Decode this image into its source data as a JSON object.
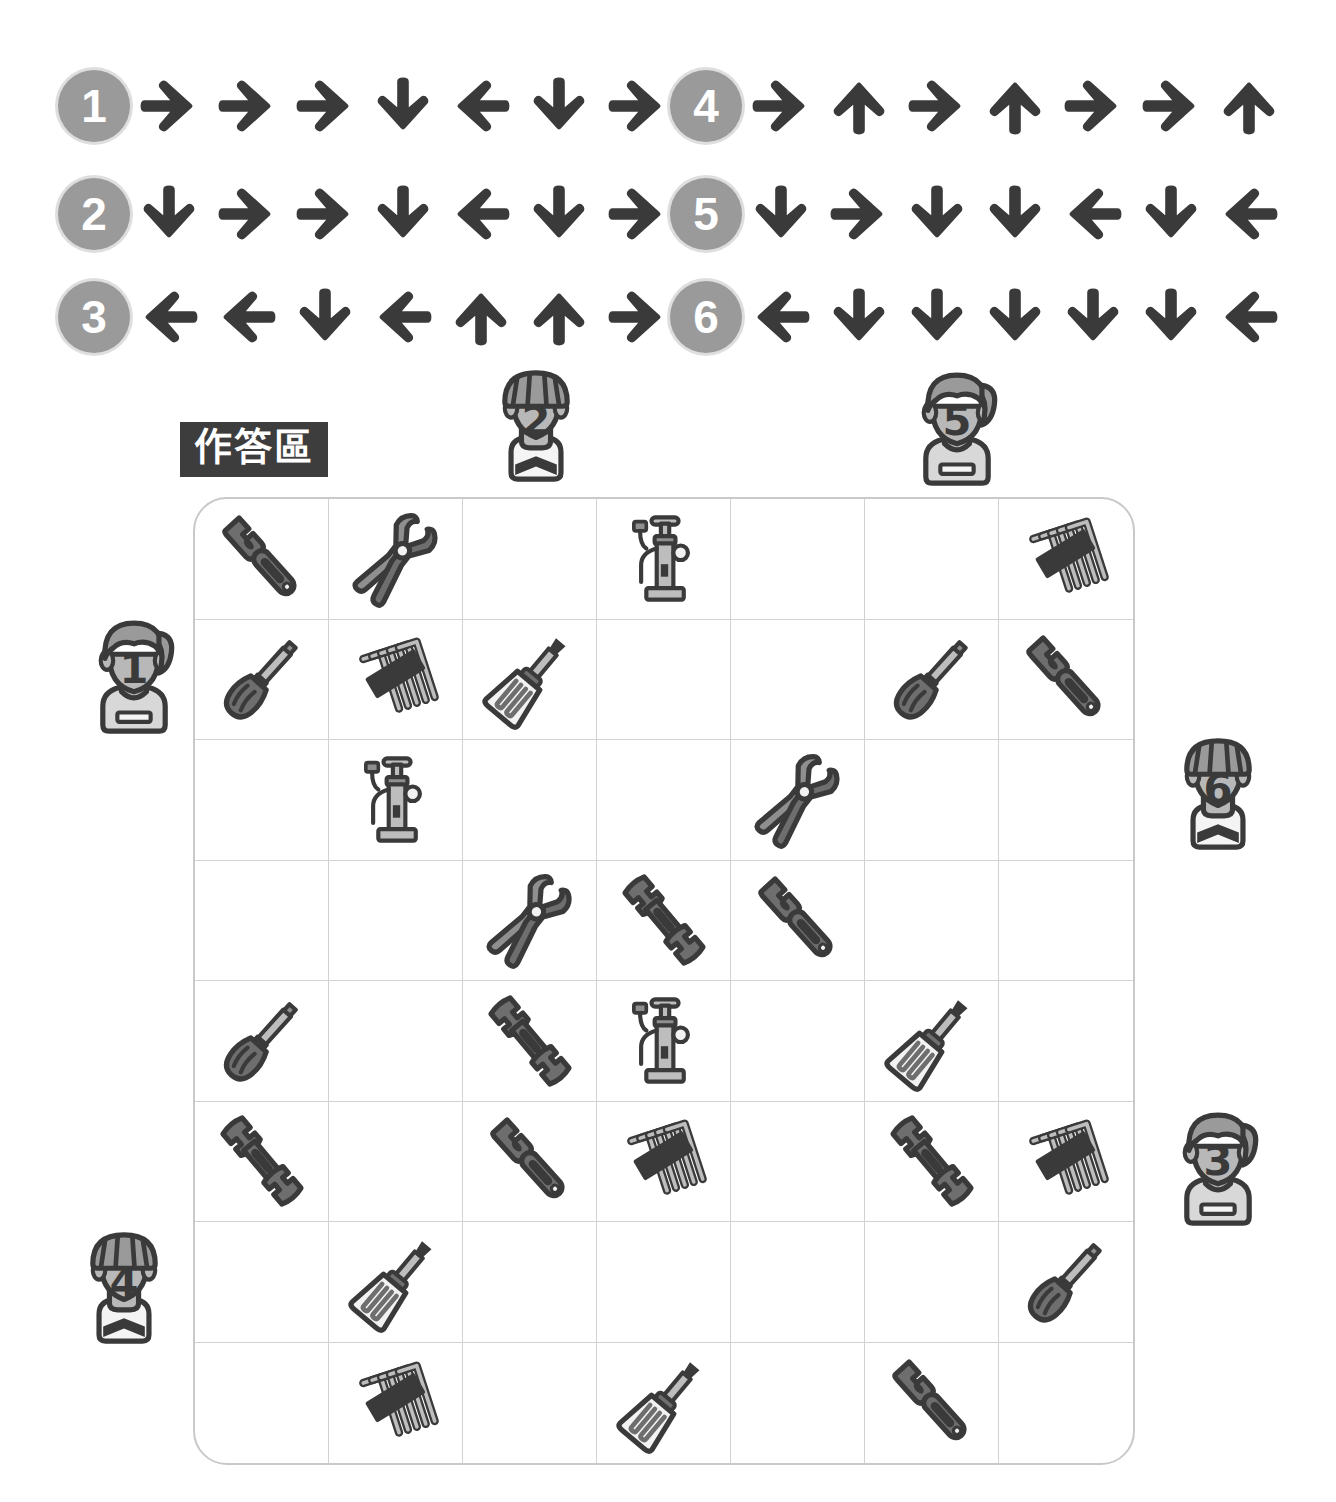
{
  "puzzle": {
    "answer_area_label": "作答區",
    "badge_color": "#9a9a9a",
    "arrow_color": "#3a3a3a",
    "grid_border_color": "#c9c9c9",
    "label_bg_color": "#3d3d3d"
  },
  "clues": [
    {
      "id": "1",
      "number": "1",
      "arrows": [
        "right",
        "right",
        "right",
        "down",
        "left",
        "down",
        "right"
      ]
    },
    {
      "id": "2",
      "number": "2",
      "arrows": [
        "down",
        "right",
        "right",
        "down",
        "left",
        "down",
        "right"
      ]
    },
    {
      "id": "3",
      "number": "3",
      "arrows": [
        "left",
        "left",
        "down",
        "left",
        "up",
        "up",
        "right"
      ]
    },
    {
      "id": "4",
      "number": "4",
      "arrows": [
        "right",
        "up",
        "right",
        "up",
        "right",
        "right",
        "up"
      ]
    },
    {
      "id": "5",
      "number": "5",
      "arrows": [
        "down",
        "right",
        "down",
        "down",
        "left",
        "down",
        "left"
      ]
    },
    {
      "id": "6",
      "number": "6",
      "arrows": [
        "left",
        "down",
        "down",
        "down",
        "down",
        "down",
        "left"
      ]
    }
  ],
  "avatars": [
    {
      "number": "2",
      "type": "cyclist",
      "position": "top",
      "align": "col-3"
    },
    {
      "number": "5",
      "type": "woman",
      "position": "top",
      "align": "col-6"
    },
    {
      "number": "1",
      "type": "woman",
      "position": "left",
      "align": "row-2"
    },
    {
      "number": "4",
      "type": "cyclist",
      "position": "left",
      "align": "row-7"
    },
    {
      "number": "6",
      "type": "cyclist",
      "position": "right",
      "align": "row-3"
    },
    {
      "number": "3",
      "type": "woman",
      "position": "right",
      "align": "row-6"
    }
  ],
  "grid": {
    "rows": 8,
    "cols": 7,
    "cells": [
      [
        "wrench-adjustable",
        "pliers",
        "",
        "pump",
        "",
        "",
        "hex-keys"
      ],
      [
        "screwdriver-dark",
        "hex-keys",
        "screwdriver-light",
        "",
        "",
        "screwdriver-dark",
        "wrench-adjustable"
      ],
      [
        "",
        "pump",
        "",
        "",
        "pliers",
        "",
        ""
      ],
      [
        "",
        "",
        "pliers",
        "wrench-open",
        "wrench-adjustable",
        "",
        ""
      ],
      [
        "screwdriver-dark",
        "",
        "wrench-open",
        "pump",
        "",
        "screwdriver-light",
        ""
      ],
      [
        "wrench-open",
        "",
        "wrench-adjustable",
        "hex-keys",
        "",
        "wrench-open",
        "hex-keys"
      ],
      [
        "",
        "screwdriver-light",
        "",
        "",
        "",
        "",
        "screwdriver-dark"
      ],
      [
        "",
        "hex-keys",
        "",
        "screwdriver-light",
        "",
        "wrench-adjustable",
        ""
      ]
    ],
    "tool_names": {
      "wrench-adjustable": "adjustable-wrench-icon",
      "wrench-open": "open-end-wrench-icon",
      "pliers": "pliers-icon",
      "pump": "bicycle-pump-icon",
      "hex-keys": "hex-key-set-icon",
      "screwdriver-dark": "flathead-screwdriver-icon",
      "screwdriver-light": "phillips-screwdriver-icon"
    }
  }
}
